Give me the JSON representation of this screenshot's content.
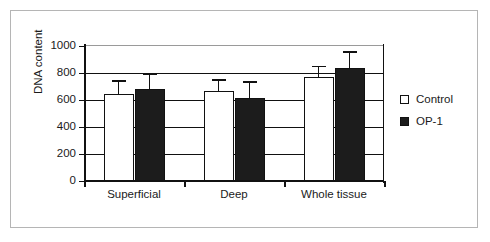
{
  "chart_data": {
    "type": "bar",
    "title": "",
    "subtitle": "",
    "xlabel": "",
    "ylabel": "DNA content",
    "ylim": [
      0,
      1000
    ],
    "yticks": [
      0,
      200,
      400,
      600,
      800,
      1000
    ],
    "ytick_labels": [
      "0",
      "200",
      "400",
      "600",
      "800",
      "1000"
    ],
    "grid": true,
    "grid_axis": "y",
    "legend_position": "right",
    "categories": [
      "Superficial",
      "Deep",
      "Whole tissue"
    ],
    "series": [
      {
        "name": "Control",
        "color": "#ffffff",
        "edge_color": "#111111",
        "values": [
          645,
          665,
          770
        ],
        "errors": [
          100,
          90,
          85
        ]
      },
      {
        "name": "OP-1",
        "color": "#1c1c1c",
        "edge_color": "#111111",
        "values": [
          680,
          615,
          837
        ],
        "errors": [
          120,
          125,
          125
        ]
      }
    ],
    "annotations": []
  },
  "legend": {
    "entries": [
      {
        "label": "Control",
        "swatch": "open-square-swatch"
      },
      {
        "label": "OP-1",
        "swatch": "filled-square-swatch"
      }
    ]
  },
  "colors": {
    "frame": "#b5b5b5",
    "axis": "#111111",
    "control_fill": "#ffffff",
    "op1_fill": "#1c1c1c",
    "background": "#ffffff"
  }
}
